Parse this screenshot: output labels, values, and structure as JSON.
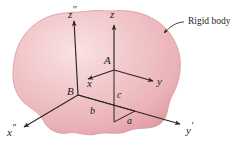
{
  "figure": {
    "type": "technical-diagram",
    "background_color": "#ffffff",
    "body": {
      "name": "rigid-body-blob",
      "fill_light": "#f7dcdd",
      "fill_mid": "#efb9bd",
      "fill_edge": "#e3969d",
      "outline_color": "#d98b93"
    },
    "line_color": "#2b2724",
    "callout": {
      "label": "Rigid body",
      "leader": "curved-arrow-to-body-edge"
    },
    "points": [
      {
        "id": "A",
        "label": "A",
        "x": 114,
        "y": 70,
        "role": "translating-frame-origin"
      },
      {
        "id": "B",
        "label": "B",
        "x": 78,
        "y": 95,
        "role": "fixed-frame-origin"
      }
    ],
    "axes": [
      {
        "id": "z2",
        "label": "z",
        "prime": "′′",
        "tip_x": 74,
        "tip_y": 18,
        "from": "B",
        "frame": "fixed"
      },
      {
        "id": "x2",
        "label": "x",
        "prime": "′′",
        "tip_x": 22,
        "tip_y": 128,
        "from": "B",
        "frame": "fixed"
      },
      {
        "id": "y1",
        "label": "y",
        "prime": "′",
        "tip_x": 182,
        "tip_y": 124,
        "from": "B",
        "frame": "fixed"
      },
      {
        "id": "z",
        "label": "z",
        "prime": "",
        "tip_x": 114,
        "tip_y": 22,
        "from": "A",
        "frame": "translating"
      },
      {
        "id": "x",
        "label": "x",
        "prime": "",
        "tip_x": 85,
        "tip_y": 80,
        "from": "A",
        "frame": "translating"
      },
      {
        "id": "y",
        "label": "y",
        "prime": "",
        "tip_x": 155,
        "tip_y": 82,
        "from": "A",
        "frame": "translating"
      }
    ],
    "dimensions": [
      {
        "id": "a",
        "label": "a",
        "x": 127,
        "y": 117,
        "meaning": "offset-along-y-prime"
      },
      {
        "id": "b",
        "label": "b",
        "x": 90,
        "y": 108,
        "meaning": "offset-along-x-double-prime"
      },
      {
        "id": "c",
        "label": "c",
        "x": 117,
        "y": 92,
        "meaning": "offset-along-z-double-prime"
      }
    ]
  }
}
